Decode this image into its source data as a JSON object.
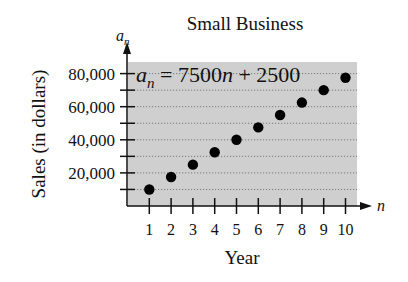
{
  "chart_data": {
    "type": "scatter",
    "title": "Small Business",
    "xlabel": "Year",
    "ylabel": "Sales (in dollars)",
    "x_axis_var": "n",
    "y_axis_var": "a_n",
    "equation": {
      "lhs": "a",
      "sub": "n",
      "rhs": " = 7500n + 2500"
    },
    "x": [
      1,
      2,
      3,
      4,
      5,
      6,
      7,
      8,
      9,
      10
    ],
    "values": [
      10000,
      17500,
      25000,
      32500,
      40000,
      47500,
      55000,
      62500,
      70000,
      77500
    ],
    "x_ticks": [
      "1",
      "2",
      "3",
      "4",
      "5",
      "6",
      "7",
      "8",
      "9",
      "10"
    ],
    "y_ticks": [
      {
        "value": 80000,
        "label": "80,000"
      },
      {
        "value": 60000,
        "label": "60,000"
      },
      {
        "value": 40000,
        "label": "40,000"
      },
      {
        "value": 20000,
        "label": "20,000"
      }
    ],
    "y_minor_ticks": [
      10000,
      30000,
      50000,
      70000
    ],
    "xlim": [
      0,
      10.5
    ],
    "ylim": [
      0,
      85000
    ],
    "grid": true,
    "legend": "none",
    "colors": {
      "plot_background": "#cfcfcf",
      "points": "#000000",
      "grid": "#7a7a7a"
    }
  }
}
